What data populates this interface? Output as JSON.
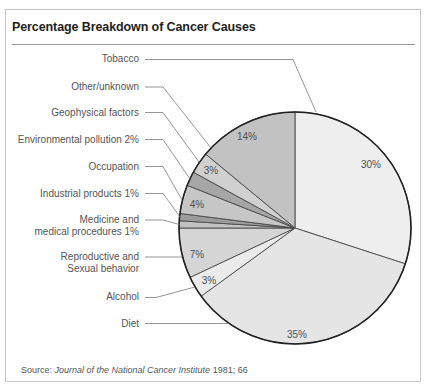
{
  "figure": {
    "title": "Percentage Breakdown of Cancer Causes",
    "source": {
      "prefix": "Source: ",
      "journal": "Journal of the National Cancer Institute",
      "suffix": " 1981; 66"
    }
  },
  "labels": {
    "tobacco": "Tobacco",
    "other_unknown": "Other/unknown",
    "geophysical": "Geophysical factors",
    "environmental_pollution": "Environmental pollution 2%",
    "occupation": "Occupation",
    "industrial_products": "Industrial products 1%",
    "medicine": [
      "Medicine and",
      "medical procedures 1%"
    ],
    "reproductive": [
      "Reproductive and",
      "Sexual behavior"
    ],
    "alcohol": "Alcohol",
    "diet": "Diet"
  },
  "slice_value_labels": {
    "tobacco": "30%",
    "diet": "35%",
    "alcohol": "3%",
    "reproductive": "7%",
    "occupation": "4%",
    "geophysical": "3%",
    "other_unknown": "14%"
  },
  "chart_data": {
    "type": "pie",
    "title": "Percentage Breakdown of Cancer Causes",
    "categories": [
      "Tobacco",
      "Diet",
      "Alcohol",
      "Reproductive and Sexual behavior",
      "Medicine and medical procedures",
      "Industrial products",
      "Occupation",
      "Environmental pollution",
      "Geophysical factors",
      "Other/unknown"
    ],
    "values": [
      30,
      35,
      3,
      7,
      1,
      1,
      4,
      2,
      3,
      14
    ],
    "unit": "%",
    "start_angle": "12 o'clock",
    "direction": "clockwise",
    "colors": [
      "#eeeeee",
      "#e5e5e5",
      "#ebebeb",
      "#d5d5d5",
      "#c2c2c2",
      "#9c9c9c",
      "#c6c6c6",
      "#a6a6a6",
      "#d0d0d0",
      "#c2c2c2"
    ],
    "legend": "leader-line labels to the left of the pie",
    "source": "Journal of the National Cancer Institute 1981; 66"
  }
}
